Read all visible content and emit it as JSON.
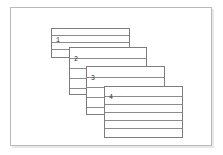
{
  "figure": {
    "panel_label": "(a)",
    "headers": {
      "layer": "Layer#",
      "material": "Material#"
    },
    "axis": {
      "theta_label": "Theta"
    },
    "colors": {
      "frame": "#b9b9b9",
      "block_border": "#7d7d7d",
      "ply_line": "#8c8c8c",
      "text": "#3a3a3a",
      "background": "#ffffff"
    },
    "theta_values": [
      "0",
      "0",
      "0",
      "0"
    ],
    "layers": [
      {
        "layer_number": "1",
        "material_number": "1",
        "ply_count": 4,
        "x": 51,
        "y": 28,
        "w": 79,
        "h": 30
      },
      {
        "layer_number": "2",
        "material_number": "2",
        "ply_count": 4,
        "x": 69,
        "y": 47,
        "w": 78,
        "h": 48
      },
      {
        "layer_number": "3",
        "material_number": "2",
        "ply_count": 4,
        "x": 86,
        "y": 66,
        "w": 79,
        "h": 49
      },
      {
        "layer_number": "4",
        "material_number": "1",
        "ply_count": 6,
        "x": 104,
        "y": 86,
        "w": 79,
        "h": 52
      }
    ]
  }
}
